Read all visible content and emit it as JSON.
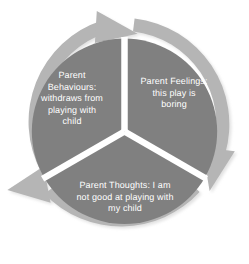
{
  "diagram": {
    "type": "cycle",
    "title": "",
    "direction": "clockwise",
    "segment_count": 3,
    "colors": {
      "segment_fill": "#808080",
      "ring_fill": "#b5b5b5",
      "ring_shadow": "#c9c9c9",
      "divider": "#ffffff",
      "label_text": "#ffffff",
      "background": "#ffffff"
    },
    "segments": [
      {
        "id": "behaviours",
        "position": "upper-left",
        "label": "Parent\nBehaviours:\nwithdraws from\nplaying with\nchild",
        "plain": "Parent Behaviours: withdraws from playing with child"
      },
      {
        "id": "feelings",
        "position": "upper-right",
        "label": "Parent Feelings:\nthis play is\nboring",
        "plain": "Parent Feelings: this play is boring"
      },
      {
        "id": "thoughts",
        "position": "bottom",
        "label": "Parent Thoughts: I am\nnot good at playing with\nmy child",
        "plain": "Parent Thoughts: I am not good at playing with my child"
      }
    ],
    "arrows": [
      {
        "id": "arrow-top",
        "position": "top",
        "points": "clockwise"
      },
      {
        "id": "arrow-bottom-right",
        "position": "bottom-right",
        "points": "clockwise"
      },
      {
        "id": "arrow-left",
        "position": "bottom-left",
        "points": "clockwise"
      }
    ]
  }
}
